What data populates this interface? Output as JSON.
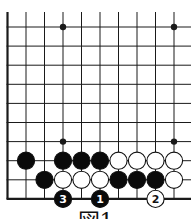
{
  "diagram": {
    "type": "go-board",
    "view": "bottom-left corner",
    "columns_visible": 10,
    "rows_visible": 10,
    "star_points": [
      {
        "col": 3,
        "row": 0
      },
      {
        "col": 9,
        "row": 0
      },
      {
        "col": 3,
        "row": 6
      },
      {
        "col": 9,
        "row": 6
      }
    ],
    "stones": [
      {
        "color": "black",
        "col": 1,
        "row": 7
      },
      {
        "color": "black",
        "col": 3,
        "row": 7
      },
      {
        "color": "black",
        "col": 4,
        "row": 7
      },
      {
        "color": "black",
        "col": 5,
        "row": 7
      },
      {
        "color": "white",
        "col": 6,
        "row": 7
      },
      {
        "color": "white",
        "col": 7,
        "row": 7
      },
      {
        "color": "white",
        "col": 8,
        "row": 7
      },
      {
        "color": "white",
        "col": 9,
        "row": 7
      },
      {
        "color": "black",
        "col": 2,
        "row": 8
      },
      {
        "color": "white",
        "col": 3,
        "row": 8
      },
      {
        "color": "white",
        "col": 4,
        "row": 8
      },
      {
        "color": "white",
        "col": 5,
        "row": 8
      },
      {
        "color": "black",
        "col": 6,
        "row": 8
      },
      {
        "color": "black",
        "col": 7,
        "row": 8
      },
      {
        "color": "black",
        "col": 8,
        "row": 8
      },
      {
        "color": "white",
        "col": 9,
        "row": 8
      },
      {
        "color": "black",
        "col": 3,
        "row": 9,
        "label": "3"
      },
      {
        "color": "black",
        "col": 5,
        "row": 9,
        "label": "1"
      },
      {
        "color": "white",
        "col": 8,
        "row": 9,
        "label": "2"
      }
    ],
    "caption": "図1",
    "colors": {
      "line": "#1a1a1a",
      "black_stone": "#0a0a0a",
      "white_stone": "#ffffff",
      "background": "#ffffff"
    }
  }
}
